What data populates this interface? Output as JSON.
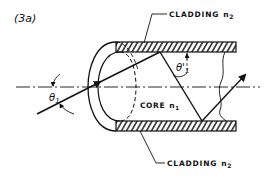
{
  "figure": {
    "label": "(3a)",
    "top_cladding_label": "CLADDING",
    "top_cladding_index": "n",
    "top_cladding_sub": "2",
    "bottom_cladding_label": "CLADDING",
    "bottom_cladding_index": "n",
    "bottom_cladding_sub": "2",
    "core_label": "CORE",
    "core_index": "n",
    "core_sub": "1",
    "incident_angle_symbol": "θ",
    "incident_angle_sub": "1",
    "internal_angle_symbol": "θ'",
    "internal_angle_sub": "1"
  },
  "colors": {
    "ink": "#111111",
    "background": "#ffffff"
  }
}
